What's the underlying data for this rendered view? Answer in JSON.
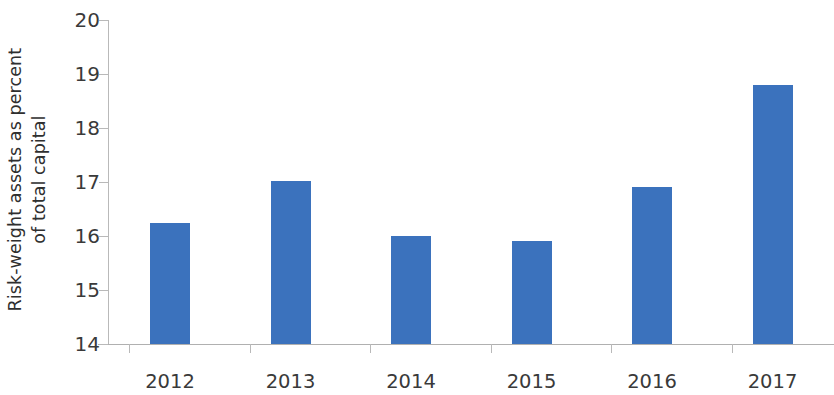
{
  "chart_data": {
    "type": "bar",
    "title": "",
    "subtitle": "",
    "xlabel": "",
    "ylabel": "Risk-weight assets as percent of total capital",
    "ylabel_lines": [
      "Risk-weight assets as percent",
      "of total capital"
    ],
    "categories": [
      "2012",
      "2013",
      "2014",
      "2015",
      "2016",
      "2017"
    ],
    "values": [
      16.25,
      17.02,
      16.0,
      15.9,
      16.9,
      18.8
    ],
    "ylim": [
      14,
      20
    ],
    "yticks": [
      14,
      15,
      16,
      17,
      18,
      19,
      20
    ],
    "ytick_labels": [
      "14",
      "15",
      "16",
      "17",
      "18",
      "19",
      "20"
    ],
    "grid": false,
    "legend": null,
    "bar_color": "#3b72bd",
    "axis_color": "#b9b9b9",
    "text_color": "#3a3a3a",
    "background": "#ffffff"
  }
}
